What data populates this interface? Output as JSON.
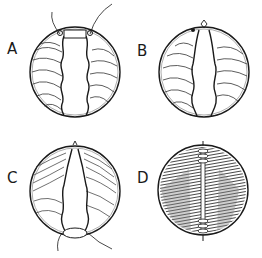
{
  "figure": {
    "panels": [
      {
        "id": "A",
        "label": "A",
        "description": "circular view, open central slit with wavy edges, two suture threads at top"
      },
      {
        "id": "B",
        "label": "B",
        "description": "circular view, central slit narrowing toward top knot"
      },
      {
        "id": "C",
        "label": "C",
        "description": "circular view, slit closed toward top, suture threads exiting at bottom"
      },
      {
        "id": "D",
        "label": "D",
        "description": "circular view, fully closed with central seam, dense dark shading"
      }
    ],
    "colors": {
      "ink": "#1a1a1a",
      "background": "#ffffff"
    }
  }
}
